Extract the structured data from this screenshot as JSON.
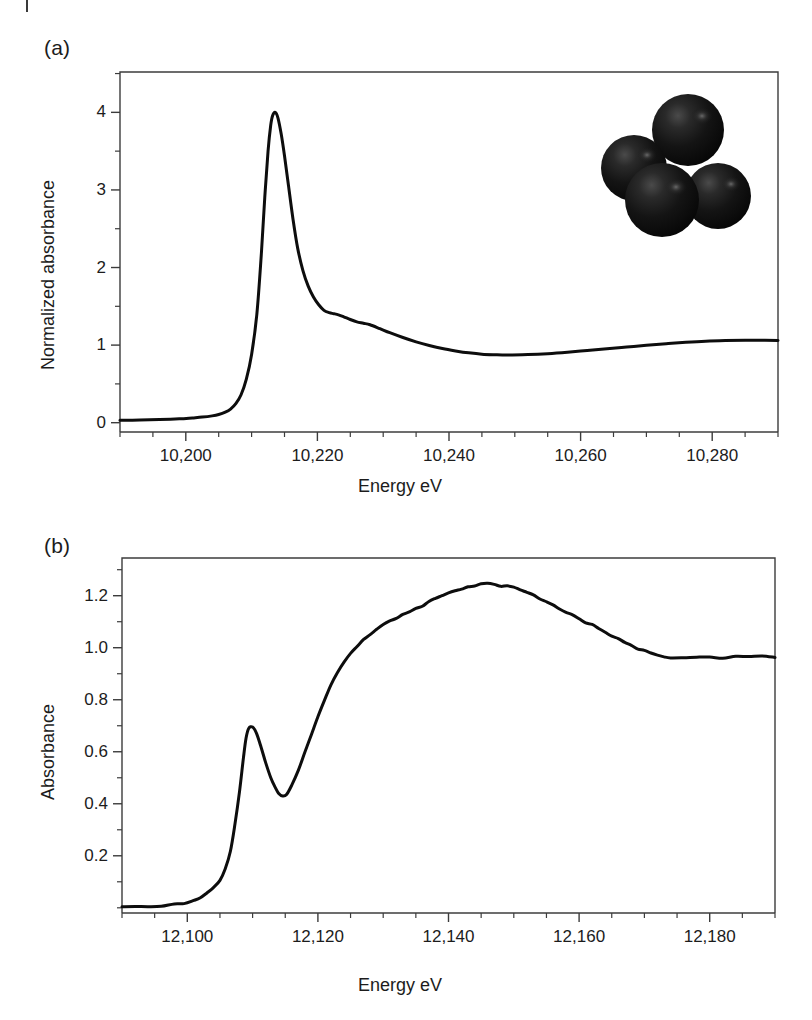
{
  "figure": {
    "width": 812,
    "height": 1020,
    "background": "#ffffff",
    "curve_color": "#0d0d0d",
    "axis_color": "#3c3c3c",
    "text_color": "#1c1c1c"
  },
  "panel_a": {
    "label": "(a)",
    "xlabel": "Energy eV",
    "ylabel": "Normalized absorbance",
    "x_ticklabels": [
      "10,200",
      "10,220",
      "10,240",
      "10,260",
      "10,280"
    ],
    "y_ticklabels": [
      "0",
      "1",
      "2",
      "3",
      "4"
    ]
  },
  "panel_b": {
    "label": "(b)",
    "xlabel": "Energy eV",
    "ylabel": "Absorbance",
    "x_ticklabels": [
      "12,100",
      "12,120",
      "12,140",
      "12,160",
      "12,180"
    ],
    "y_ticklabels": [
      "0.2",
      "0.4",
      "0.6",
      "0.8",
      "1.0",
      "1.2"
    ]
  },
  "inset": {
    "name": "tetrahedral-cluster",
    "sphere_color": "#111111",
    "spheres": [
      {
        "cx": 688,
        "cy": 130,
        "r": 36,
        "hlx": 702,
        "hly": 116
      },
      {
        "cx": 634,
        "cy": 168,
        "r": 33,
        "hlx": 647,
        "hly": 155
      },
      {
        "cx": 718,
        "cy": 196,
        "r": 33,
        "hlx": 731,
        "hly": 184
      },
      {
        "cx": 662,
        "cy": 200,
        "r": 37,
        "hlx": 676,
        "hly": 187
      }
    ]
  },
  "chart_data": [
    {
      "type": "line",
      "panel": "(a)",
      "title": "",
      "xlabel": "Energy eV",
      "ylabel": "Normalized absorbance",
      "xlim": [
        10190,
        10290
      ],
      "ylim": [
        -0.12,
        4.52
      ],
      "xticks": [
        10200,
        10220,
        10240,
        10260,
        10280
      ],
      "yticks": [
        0,
        1,
        2,
        3,
        4
      ],
      "xminor_step": 5,
      "yminor_step": 0.5,
      "grid": false,
      "legend": null,
      "series": [
        {
          "name": "Normalized absorbance",
          "x": [
            10190,
            10193,
            10196,
            10199,
            10201,
            10202.5,
            10204,
            10205,
            10206,
            10206.8,
            10207.6,
            10208.4,
            10209.2,
            10210,
            10210.8,
            10211.5,
            10212,
            10212.5,
            10212.9,
            10213.2,
            10213.6,
            10214,
            10214.5,
            10215,
            10215.6,
            10216.3,
            10217,
            10217.8,
            10218.6,
            10219.4,
            10220.2,
            10221,
            10221.8,
            10222.5,
            10223.2,
            10224,
            10225,
            10226,
            10227,
            10228,
            10229.5,
            10231,
            10233,
            10235,
            10237,
            10239,
            10241,
            10243,
            10245,
            10247,
            10249,
            10252,
            10255,
            10258,
            10261,
            10264,
            10267,
            10270,
            10273,
            10276,
            10279,
            10282,
            10285,
            10288,
            10290
          ],
          "y": [
            0.03,
            0.034,
            0.04,
            0.05,
            0.062,
            0.072,
            0.088,
            0.105,
            0.135,
            0.175,
            0.245,
            0.36,
            0.56,
            0.88,
            1.4,
            2.2,
            2.9,
            3.5,
            3.83,
            3.96,
            4.0,
            3.93,
            3.72,
            3.44,
            3.06,
            2.62,
            2.25,
            1.96,
            1.76,
            1.62,
            1.52,
            1.448,
            1.418,
            1.405,
            1.39,
            1.365,
            1.33,
            1.3,
            1.282,
            1.262,
            1.212,
            1.16,
            1.098,
            1.042,
            0.995,
            0.955,
            0.925,
            0.9,
            0.882,
            0.875,
            0.872,
            0.878,
            0.89,
            0.908,
            0.93,
            0.952,
            0.975,
            0.998,
            1.018,
            1.036,
            1.05,
            1.058,
            1.062,
            1.062,
            1.06
          ]
        }
      ]
    },
    {
      "type": "line",
      "panel": "(b)",
      "title": "",
      "xlabel": "Energy eV",
      "ylabel": "Absorbance",
      "xlim": [
        12090,
        12190
      ],
      "ylim": [
        -0.02,
        1.345
      ],
      "xticks": [
        12100,
        12120,
        12140,
        12160,
        12180
      ],
      "yticks": [
        0.2,
        0.4,
        0.6,
        0.8,
        1.0,
        1.2
      ],
      "xminor_step": 5,
      "yminor_step": 0.1,
      "grid": false,
      "legend": null,
      "series": [
        {
          "name": "Absorbance",
          "x": [
            12090,
            12092,
            12094,
            12096,
            12098,
            12099.5,
            12101,
            12102,
            12103,
            12104,
            12105,
            12105.8,
            12106.6,
            12107.3,
            12108,
            12108.6,
            12109,
            12109.4,
            12110,
            12110.6,
            12111.3,
            12112,
            12112.8,
            12113.5,
            12114,
            12114.6,
            12115.2,
            12116,
            12117,
            12118,
            12119,
            12120,
            12121,
            12122,
            12123,
            12124,
            12125,
            12126,
            12127,
            12128,
            12129,
            12130,
            12131,
            12132,
            12133,
            12134,
            12135,
            12136,
            12137,
            12138,
            12139,
            12140,
            12141,
            12142,
            12143,
            12144,
            12145,
            12146,
            12147,
            12148,
            12149,
            12150,
            12151,
            12152,
            12153,
            12154,
            12155,
            12156,
            12157,
            12158,
            12159,
            12160,
            12161,
            12162,
            12163,
            12164,
            12165,
            12166,
            12167,
            12168,
            12169,
            12170,
            12171,
            12172,
            12173,
            12174,
            12176,
            12178,
            12180,
            12182,
            12184,
            12186,
            12188,
            12190
          ],
          "y": [
            0.005,
            0.004,
            0.006,
            0.008,
            0.012,
            0.018,
            0.03,
            0.04,
            0.055,
            0.075,
            0.108,
            0.148,
            0.215,
            0.32,
            0.45,
            0.58,
            0.65,
            0.686,
            0.693,
            0.672,
            0.62,
            0.56,
            0.5,
            0.46,
            0.437,
            0.43,
            0.438,
            0.47,
            0.528,
            0.595,
            0.665,
            0.735,
            0.8,
            0.858,
            0.905,
            0.945,
            0.978,
            1.005,
            1.03,
            1.052,
            1.072,
            1.09,
            1.102,
            1.112,
            1.125,
            1.14,
            1.152,
            1.162,
            1.175,
            1.188,
            1.198,
            1.208,
            1.218,
            1.226,
            1.234,
            1.24,
            1.244,
            1.245,
            1.242,
            1.238,
            1.236,
            1.23,
            1.222,
            1.212,
            1.2,
            1.188,
            1.176,
            1.162,
            1.148,
            1.138,
            1.126,
            1.112,
            1.098,
            1.086,
            1.072,
            1.058,
            1.044,
            1.032,
            1.02,
            1.008,
            0.998,
            0.988,
            0.98,
            0.974,
            0.968,
            0.964,
            0.96,
            0.962,
            0.964,
            0.962,
            0.964,
            0.966,
            0.966,
            0.964
          ]
        }
      ]
    }
  ]
}
